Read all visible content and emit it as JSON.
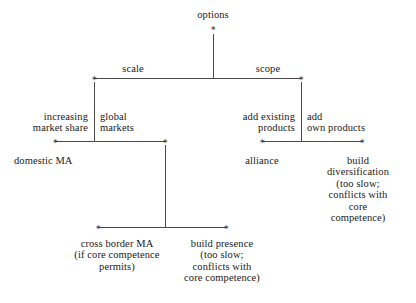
{
  "diagram": {
    "title": "options",
    "node_marker": "∗",
    "line_color": "#4a4a4a",
    "text_color": "#191919",
    "background": "#ffffff",
    "root": {
      "label": "options"
    },
    "level1": {
      "left_branch_label": "scale",
      "right_branch_label": "scope"
    },
    "scale_subtree": {
      "left_edge_label": "increasing\nmarket share",
      "right_edge_label": "global\nmarkets",
      "left_leaf": "domestic MA",
      "global_markets_children": {
        "left_leaf": "cross border MA\n(if core competence\npermits)",
        "right_leaf": "build presence\n(too slow;\nconflicts with\ncore competence)"
      }
    },
    "scope_subtree": {
      "left_edge_label": "add existing\nproducts",
      "right_edge_label": "add\nown products",
      "left_leaf": "alliance",
      "right_leaf": "build\ndiversification\n(too slow;\nconflicts with\ncore competence)"
    }
  }
}
